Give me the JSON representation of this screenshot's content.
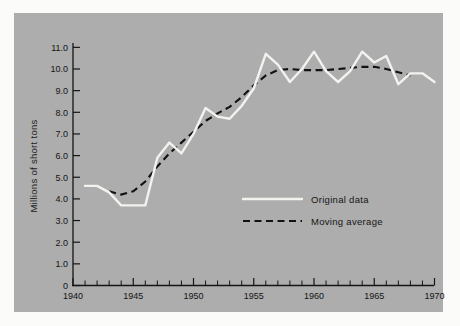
{
  "chart_data": {
    "type": "line",
    "title": "",
    "xlabel": "",
    "ylabel": "Millions of short tons",
    "xlim": [
      1940,
      1970
    ],
    "ylim": [
      0,
      11.5
    ],
    "grid": false,
    "legend_position": "center-right",
    "x_tick_labels": [
      "1940",
      "1945",
      "1950",
      "1955",
      "1960",
      "1965",
      "1970"
    ],
    "x_tick_values": [
      1940,
      1945,
      1950,
      1955,
      1960,
      1965,
      1970
    ],
    "x_minor_tick_step": 1,
    "y_tick_labels": [
      "0",
      "1.0",
      "2.0",
      "3.0",
      "4.0",
      "5.0",
      "6.0",
      "7.0",
      "8.0",
      "9.0",
      "10.0",
      "11.0"
    ],
    "y_tick_values": [
      0,
      1.0,
      2.0,
      3.0,
      4.0,
      5.0,
      6.0,
      7.0,
      8.0,
      9.0,
      10.0,
      11.0
    ],
    "series": [
      {
        "name": "Original data",
        "style": "solid",
        "color": "#f2f2ee",
        "x": [
          1941,
          1942,
          1943,
          1944,
          1945,
          1946,
          1947,
          1948,
          1949,
          1950,
          1951,
          1952,
          1953,
          1954,
          1955,
          1956,
          1957,
          1958,
          1959,
          1960,
          1961,
          1962,
          1963,
          1964,
          1965,
          1966,
          1967,
          1968,
          1969,
          1970
        ],
        "values": [
          4.6,
          4.6,
          4.3,
          3.7,
          3.7,
          3.7,
          5.9,
          6.6,
          6.1,
          7.0,
          8.2,
          7.8,
          7.7,
          8.3,
          9.1,
          10.7,
          10.2,
          9.4,
          10.0,
          10.8,
          9.9,
          9.4,
          9.9,
          10.8,
          10.3,
          10.6,
          9.3,
          9.8,
          9.8,
          9.4
        ]
      },
      {
        "name": "Moving average",
        "style": "dashed",
        "color": "#121212",
        "x": [
          1943,
          1944,
          1945,
          1946,
          1947,
          1948,
          1949,
          1950,
          1951,
          1952,
          1953,
          1954,
          1955,
          1956,
          1957,
          1958,
          1959,
          1960,
          1961,
          1962,
          1963,
          1964,
          1965,
          1966,
          1967,
          1968
        ],
        "values": [
          4.35,
          4.2,
          4.35,
          4.8,
          5.5,
          6.1,
          6.6,
          7.1,
          7.6,
          7.95,
          8.25,
          8.7,
          9.25,
          9.7,
          9.95,
          10.0,
          9.95,
          9.95,
          9.95,
          10.0,
          10.05,
          10.1,
          10.1,
          10.0,
          9.85,
          9.7
        ]
      }
    ]
  },
  "legend": {
    "entries": [
      {
        "label": "Original data",
        "swatch": "solid-white-line"
      },
      {
        "label": "Moving average",
        "swatch": "dashed-black-line"
      }
    ]
  }
}
